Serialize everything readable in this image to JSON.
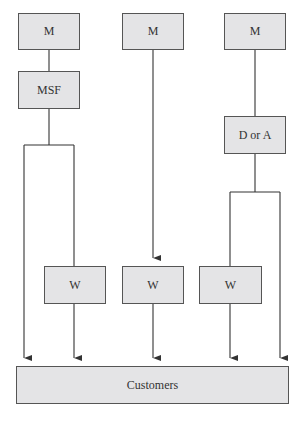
{
  "diagram": {
    "type": "distribution-channels",
    "colors": {
      "box_fill": "#e4e4e6",
      "box_border": "#555555",
      "line": "#333333",
      "text": "#333333"
    },
    "nodes": {
      "m1": {
        "label": "M"
      },
      "m2": {
        "label": "M"
      },
      "m3": {
        "label": "M"
      },
      "msf": {
        "label": "MSF"
      },
      "dora": {
        "label": "D or A"
      },
      "w1": {
        "label": "W"
      },
      "w2": {
        "label": "W"
      },
      "w3": {
        "label": "W"
      },
      "customers": {
        "label": "Customers"
      }
    },
    "edges": [
      {
        "from": "m1",
        "to": "msf"
      },
      {
        "from": "msf",
        "to": "customers"
      },
      {
        "from": "msf",
        "to": "w1"
      },
      {
        "from": "w1",
        "to": "customers"
      },
      {
        "from": "m2",
        "to": "w2"
      },
      {
        "from": "w2",
        "to": "customers"
      },
      {
        "from": "m3",
        "to": "dora"
      },
      {
        "from": "dora",
        "to": "w3"
      },
      {
        "from": "dora",
        "to": "customers"
      },
      {
        "from": "w3",
        "to": "customers"
      }
    ]
  }
}
